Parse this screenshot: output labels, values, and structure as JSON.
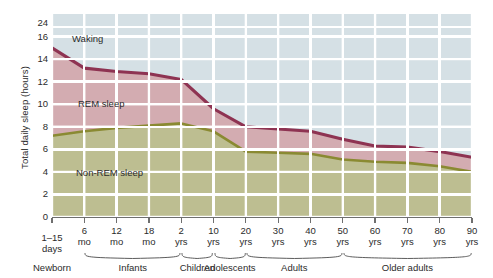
{
  "chart_data": {
    "type": "area",
    "title": "",
    "subtitle": "",
    "xlabel": "",
    "ylabel": "Total daily sleep (hours)",
    "ylim": [
      0,
      18
    ],
    "y_axis_break": {
      "present": true,
      "between": [
        16,
        24
      ],
      "note": "axis break between 16 and 24"
    },
    "yticks": [
      0,
      2,
      4,
      6,
      8,
      10,
      12,
      14,
      16,
      24
    ],
    "grid": true,
    "legend_position": "in-plot annotations",
    "annotations": [
      "Waking",
      "REM sleep",
      "Non-REM sleep"
    ],
    "x_tick_labels": [
      {
        "line1": "1–15",
        "line2": "days"
      },
      {
        "line1": "6",
        "line2": "mo"
      },
      {
        "line1": "12",
        "line2": "mo"
      },
      {
        "line1": "18",
        "line2": "mo"
      },
      {
        "line1": "2",
        "line2": "yrs"
      },
      {
        "line1": "10",
        "line2": "yrs"
      },
      {
        "line1": "20",
        "line2": "yrs"
      },
      {
        "line1": "30",
        "line2": "yrs"
      },
      {
        "line1": "40",
        "line2": "yrs"
      },
      {
        "line1": "50",
        "line2": "yrs"
      },
      {
        "line1": "60",
        "line2": "yrs"
      },
      {
        "line1": "70",
        "line2": "yrs"
      },
      {
        "line1": "80",
        "line2": "yrs"
      },
      {
        "line1": "90",
        "line2": "yrs"
      }
    ],
    "age_groups": [
      {
        "label": "Newborn",
        "start_index": 0,
        "end_index": 0
      },
      {
        "label": "Infants",
        "start_index": 1,
        "end_index": 4
      },
      {
        "label": "Children",
        "start_index": 4,
        "end_index": 5
      },
      {
        "label": "Adolescents",
        "start_index": 5,
        "end_index": 6
      },
      {
        "label": "Adults",
        "start_index": 6,
        "end_index": 9
      },
      {
        "label": "Older adults",
        "start_index": 9,
        "end_index": 13
      }
    ],
    "x": [
      0,
      1,
      2,
      3,
      4,
      5,
      6,
      7,
      8,
      9,
      10,
      11,
      12,
      13
    ],
    "series": [
      {
        "name": "Total sleep",
        "color": "#8e3352",
        "values": [
          15.0,
          13.2,
          12.9,
          12.7,
          12.2,
          9.6,
          8.0,
          7.8,
          7.6,
          6.9,
          6.3,
          6.2,
          5.8,
          5.3
        ]
      },
      {
        "name": "Non-REM sleep",
        "color": "#8a8a32",
        "values": [
          7.2,
          7.6,
          7.9,
          8.1,
          8.3,
          7.6,
          5.8,
          5.7,
          5.6,
          5.1,
          4.9,
          4.8,
          4.5,
          4.0
        ]
      }
    ],
    "bands": [
      {
        "name": "Waking",
        "color": "#d5e0e5",
        "from": "Total sleep",
        "to": "top"
      },
      {
        "name": "REM sleep",
        "color": "#d2a7ad",
        "from": "Non-REM sleep",
        "to": "Total sleep"
      },
      {
        "name": "Non-REM sleep",
        "color": "#bcbc8c",
        "from": "0",
        "to": "Non-REM sleep"
      }
    ]
  },
  "colors": {
    "plot_background": "#d5e0e5",
    "gridline": "#ffffff",
    "rem_fill": "#d2a7ad",
    "nonrem_fill": "#bcbc8c",
    "total_line": "#8e3352",
    "nonrem_line": "#8a8a32",
    "axis": "#6f6f6f",
    "text": "#2b2b2b"
  }
}
